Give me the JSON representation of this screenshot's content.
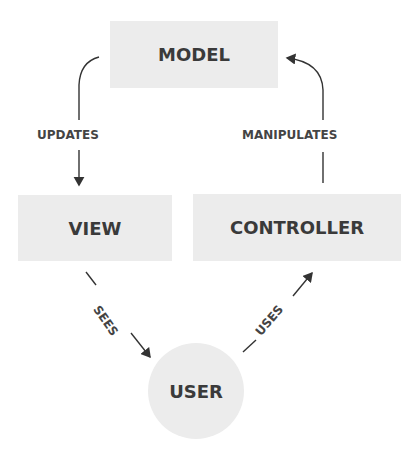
{
  "diagram": {
    "nodes": {
      "model": "MODEL",
      "view": "VIEW",
      "controller": "CONTROLLER",
      "user": "USER"
    },
    "edges": {
      "updates": "UPDATES",
      "manipulates": "MANIPULATES",
      "sees": "SEES",
      "uses": "USES"
    },
    "colors": {
      "node_fill": "#ececec",
      "text": "#3a3a3a",
      "line": "#333333"
    }
  }
}
